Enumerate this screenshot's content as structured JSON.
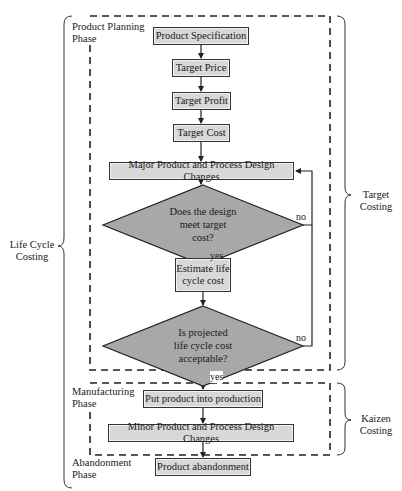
{
  "diagram": {
    "groups": {
      "life_cycle": {
        "label_line1": "Life Cycle",
        "label_line2": "Costing"
      },
      "target_costing": {
        "label_line1": "Target",
        "label_line2": "Costing"
      },
      "kaizen_costing": {
        "label_line1": "Kaizen",
        "label_line2": "Costing"
      }
    },
    "phases": {
      "planning": {
        "line1": "Product Planning",
        "line2": "Phase"
      },
      "manufacturing": {
        "line1": "Manufacturing",
        "line2": "Phase"
      },
      "abandonment": {
        "line1": "Abandonment",
        "line2": "Phase"
      }
    },
    "nodes": {
      "product_specification": "Product Specification",
      "target_price": "Target Price",
      "target_profit": "Target Profit",
      "target_cost": "Target Cost",
      "major_changes": "Major Product and Process Design Changes",
      "decision_target_cost": {
        "line1": "Does the design",
        "line2": "meet target",
        "line3": "cost?"
      },
      "estimate_life_cycle": {
        "line1": "Estimate life",
        "line2": "cycle cost"
      },
      "decision_life_cycle": {
        "line1": "Is projected",
        "line2": "life cycle cost",
        "line3": "acceptable?"
      },
      "put_into_production": "Put product into production",
      "minor_changes": "Minor Product and Process Design Changes",
      "product_abandonment": "Product abandonment"
    },
    "edge_labels": {
      "decision1_yes": "yes",
      "decision1_no": "no",
      "decision2_yes": "yes",
      "decision2_no": "no"
    },
    "colors": {
      "box_fill": "#d8d8d8",
      "diamond_fill": "#a8a8a8",
      "stroke": "#222222",
      "background": "#ffffff"
    }
  }
}
